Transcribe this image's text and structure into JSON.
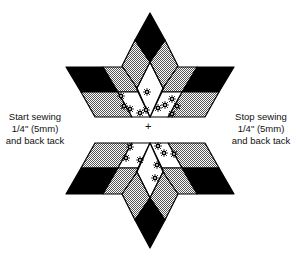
{
  "diagram": {
    "colors": {
      "dark": "#000000",
      "medium_pattern": "#a8a8a8",
      "light": "#ffffff",
      "outline": "#000000"
    },
    "labels": {
      "start": {
        "line1": "Start sewing",
        "line2": "1/4\" (5mm)",
        "line3": "and back tack"
      },
      "stop": {
        "line1": "Stop sewing",
        "line2": "1/4\" (5mm)",
        "line3": "and back tack"
      },
      "center_mark": "+"
    },
    "pieces": {
      "top_half": [
        "dark tip diamond",
        "two medium diamonds",
        "light floral center",
        "left dark/medium parallelograms",
        "right dark/medium parallelograms",
        "light floral side pieces"
      ],
      "bottom_half": [
        "dark tip diamond",
        "two medium diamonds",
        "light floral center",
        "left dark/medium parallelograms",
        "right dark/medium parallelograms",
        "light floral side pieces"
      ]
    }
  }
}
